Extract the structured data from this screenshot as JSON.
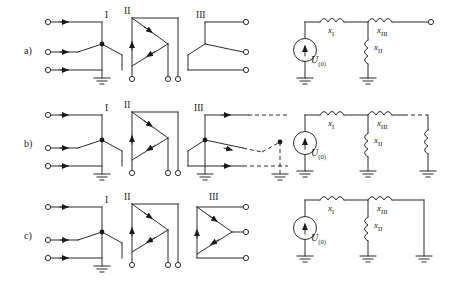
{
  "figure": {
    "title": "",
    "background": "#ffffff",
    "line_color": "#2b2b2b",
    "rows": [
      {
        "row_label": "a)",
        "sub_labels": [
          "I",
          "II",
          "III"
        ],
        "right_circuit": {
          "source_label": "U",
          "source_sub": "(0)",
          "elements": [
            {
              "name": "x",
              "sub": "I"
            },
            {
              "name": "x",
              "sub": "II"
            },
            {
              "name": "x",
              "sub": "III"
            }
          ],
          "termination": "open-terminal"
        }
      },
      {
        "row_label": "b)",
        "sub_labels": [
          "I",
          "II",
          "III"
        ],
        "right_circuit": {
          "source_label": "U",
          "source_sub": "(0)",
          "elements": [
            {
              "name": "x",
              "sub": "I"
            },
            {
              "name": "x",
              "sub": "II"
            },
            {
              "name": "x",
              "sub": "III"
            }
          ],
          "termination": "dashed-branch-to-ground"
        }
      },
      {
        "row_label": "c)",
        "sub_labels": [
          "I",
          "II",
          "III"
        ],
        "right_circuit": {
          "source_label": "U",
          "source_sub": "(0)",
          "elements": [
            {
              "name": "x",
              "sub": "I"
            },
            {
              "name": "x",
              "sub": "II"
            },
            {
              "name": "x",
              "sub": "III"
            }
          ],
          "termination": "ground"
        }
      }
    ]
  }
}
